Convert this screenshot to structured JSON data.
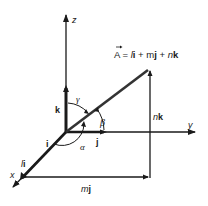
{
  "diagram": {
    "colors": {
      "line": "#1a1a1a",
      "background": "#ffffff"
    },
    "axes": {
      "x_label": "x",
      "y_label": "y",
      "z_label": "z"
    },
    "unit_vectors": {
      "i_label": "i",
      "j_label": "j",
      "k_label": "k"
    },
    "components": {
      "x_component": "li",
      "x_component_scalar": "l",
      "x_component_unit": "i",
      "y_component": "mj",
      "y_component_scalar": "m",
      "y_component_unit": "j",
      "z_component": "nk",
      "z_component_scalar": "n",
      "z_component_unit": "k"
    },
    "vector_equation": {
      "lhs": "A",
      "equals": "=",
      "term1_scalar": "l",
      "term1_unit": "i",
      "plus1": "+",
      "term2_scalar": "m",
      "term2_unit": "j",
      "plus2": "+",
      "term3_scalar": "n",
      "term3_unit": "k",
      "full_text": "A = li + mj + nk"
    },
    "angles": {
      "alpha": "α",
      "beta": "β",
      "gamma": "γ"
    }
  }
}
